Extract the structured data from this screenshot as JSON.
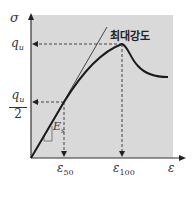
{
  "diagram": {
    "type": "stress-strain curve",
    "y_axis_symbol": "σ",
    "x_axis_symbol": "ε",
    "qu_label": "q",
    "qu_sub": "u",
    "half_label_num_main": "q",
    "half_label_num_sub": "u",
    "half_label_den": "2",
    "e50_main": "ε",
    "e50_sub": "50",
    "e100_main": "ε",
    "e100_sub": "100",
    "modulus_main": "E",
    "modulus_sub": "s",
    "peak_label": "최대강도",
    "colors": {
      "background": "#d9d9d9",
      "curve": "#1a1a1a",
      "axis": "#333333",
      "dashed": "#444444"
    }
  }
}
